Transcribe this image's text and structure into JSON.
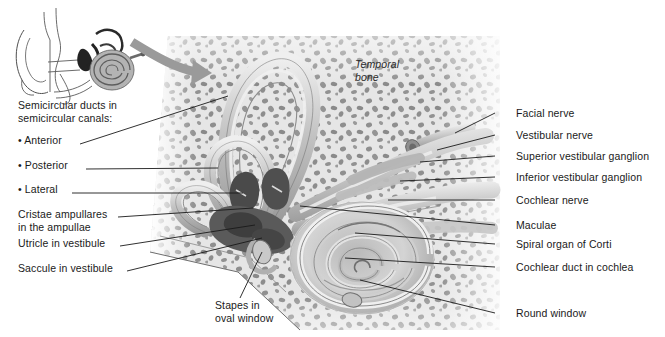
{
  "figure": {
    "title_alt": "Inner ear within the temporal bone",
    "inset": {
      "name": "ear-overview-inset",
      "description": "small line drawing of whole ear in profile with cochlea shaded"
    },
    "arrow": {
      "name": "magnify-arrow",
      "description": "curved gray arrow from inset to main illustration"
    },
    "in_figure_labels": [
      {
        "id": "temporal-bone",
        "text_line1": "Temporal",
        "text_line2": "bone",
        "x": 355,
        "y": 64,
        "italic": true
      }
    ],
    "left_labels": [
      {
        "id": "heading-semicircular",
        "text": "Semicircular ducts in",
        "x": 18,
        "y": 105,
        "leader": false
      },
      {
        "id": "heading-semicircular-2",
        "text": "semicircular canals:",
        "x": 18,
        "y": 118,
        "leader": false
      },
      {
        "id": "anterior",
        "text": "• Anterior",
        "x": 18,
        "y": 140,
        "leader": true,
        "lx1": 80,
        "ly1": 144,
        "lx2": 228,
        "ly2": 96
      },
      {
        "id": "posterior",
        "text": "• Posterior",
        "x": 18,
        "y": 165,
        "leader": true,
        "lx1": 86,
        "ly1": 169,
        "lx2": 218,
        "ly2": 168
      },
      {
        "id": "lateral",
        "text": "• Lateral",
        "x": 18,
        "y": 189,
        "leader": true,
        "lx1": 72,
        "ly1": 193,
        "lx2": 243,
        "ly2": 193
      },
      {
        "id": "cristae",
        "text": "Cristae ampullares",
        "x": 18,
        "y": 214,
        "leader": true,
        "lx1": 118,
        "ly1": 217,
        "lx2": 253,
        "ly2": 208
      },
      {
        "id": "cristae-2",
        "text": "in the ampullae",
        "x": 18,
        "y": 227,
        "leader": false
      },
      {
        "id": "utricle",
        "text": "Utricle in vestibule",
        "x": 18,
        "y": 243,
        "leader": true,
        "lx1": 120,
        "ly1": 246,
        "lx2": 255,
        "ly2": 225
      },
      {
        "id": "saccule",
        "text": "Saccule in vestibule",
        "x": 18,
        "y": 268,
        "leader": true,
        "lx1": 127,
        "ly1": 271,
        "lx2": 262,
        "ly2": 238
      }
    ],
    "bottom_labels": [
      {
        "id": "stapes",
        "text_line1": "Stapes in",
        "text_line2": "oval window",
        "x": 215,
        "y": 305,
        "leader": true,
        "lx1": 240,
        "ly1": 298,
        "lx2": 262,
        "ly2": 252
      }
    ],
    "right_labels": [
      {
        "id": "facial-nerve",
        "text": "Facial nerve",
        "x": 516,
        "y": 113,
        "lx1": 495,
        "ly1": 113,
        "lx2": 455,
        "ly2": 133
      },
      {
        "id": "vestibular-nerve",
        "text": "Vestibular nerve",
        "x": 516,
        "y": 135,
        "lx1": 495,
        "ly1": 135,
        "lx2": 437,
        "ly2": 150
      },
      {
        "id": "superior-vestibular-ganglion",
        "text": "Superior vestibular ganglion",
        "x": 516,
        "y": 156,
        "lx1": 495,
        "ly1": 156,
        "lx2": 420,
        "ly2": 162
      },
      {
        "id": "inferior-vestibular-ganglion",
        "text": "Inferior vestibular ganglion",
        "x": 516,
        "y": 177,
        "lx1": 495,
        "ly1": 177,
        "lx2": 400,
        "ly2": 181
      },
      {
        "id": "cochlear-nerve",
        "text": "Cochlear nerve",
        "x": 516,
        "y": 200,
        "lx1": 495,
        "ly1": 200,
        "lx2": 388,
        "ly2": 200
      },
      {
        "id": "maculae",
        "text": "Maculae",
        "x": 516,
        "y": 225,
        "lx1": 495,
        "ly1": 225,
        "lx2": 300,
        "ly2": 206
      },
      {
        "id": "spiral-organ",
        "text": "Spiral organ of Corti",
        "x": 516,
        "y": 244,
        "lx1": 495,
        "ly1": 244,
        "lx2": 355,
        "ly2": 233
      },
      {
        "id": "cochlear-duct",
        "text": "Cochlear duct in cochlea",
        "x": 516,
        "y": 267,
        "lx1": 495,
        "ly1": 267,
        "lx2": 345,
        "ly2": 258
      },
      {
        "id": "round-window",
        "text": "Round window",
        "x": 516,
        "y": 313,
        "lx1": 495,
        "ly1": 313,
        "lx2": 360,
        "ly2": 280
      }
    ],
    "colors": {
      "background": "#ffffff",
      "bone_light": "#e2e2e2",
      "bone_speck": "#8d8d8d",
      "duct_light": "#d8d8d8",
      "duct_mid": "#a9a9a9",
      "duct_dark": "#4a4a4a",
      "nerve_light": "#cfcfcf",
      "nerve_mid": "#a0a0a0",
      "arrow_gray": "#9a9a9a",
      "text": "#1a1a1a",
      "leader": "#1a1a1a"
    }
  }
}
